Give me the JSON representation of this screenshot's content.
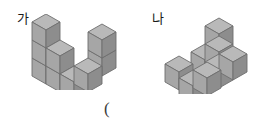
{
  "page": {
    "background_color": "#ffffff",
    "width": 259,
    "height": 129
  },
  "labels": {
    "left_figure": "가",
    "right_figure": "나",
    "answer_paren": "("
  },
  "colors": {
    "cube_top": "#b9b9b9",
    "cube_left": "#a6a6a6",
    "cube_right": "#8d8d8d",
    "cube_outline": "#6e6e6e",
    "text": "#1a1a1a"
  },
  "figures": [
    {
      "name": "left-figure",
      "label": "가",
      "cube_count": 8,
      "description": "Isometric stack of unit cubes forming a stepped L shape: a three-high column at the left rear, a two-high step in the middle, a one-high cube at the front, and a two-high column at the right.",
      "cubes": [
        {
          "x": 0,
          "y": 0,
          "z": 0
        },
        {
          "x": 0,
          "y": 0,
          "z": 1
        },
        {
          "x": 0,
          "y": 0,
          "z": 2
        },
        {
          "x": 1,
          "y": 0,
          "z": 0
        },
        {
          "x": 1,
          "y": 0,
          "z": 1
        },
        {
          "x": 1,
          "y": 1,
          "z": 0
        },
        {
          "x": 2,
          "y": 1,
          "z": 0
        },
        {
          "x": 2,
          "y": 1,
          "z": 1
        }
      ]
    },
    {
      "name": "right-figure",
      "label": "나",
      "cube_count": 8,
      "description": "Isometric stack of unit cubes forming a pyramid-like staircase: a bottom row of three cubes with a front cube, a middle level of two cubes, and a single cube on top.",
      "cubes": [
        {
          "x": 0,
          "y": 0,
          "z": 0
        },
        {
          "x": 1,
          "y": 0,
          "z": 0
        },
        {
          "x": 2,
          "y": 0,
          "z": 0
        },
        {
          "x": 1,
          "y": 1,
          "z": 0
        },
        {
          "x": 2,
          "y": 1,
          "z": 0
        },
        {
          "x": 1,
          "y": 0,
          "z": 1
        },
        {
          "x": 2,
          "y": 0,
          "z": 1
        },
        {
          "x": 2,
          "y": 0,
          "z": 2
        }
      ]
    }
  ]
}
